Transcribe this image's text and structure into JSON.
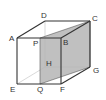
{
  "diagram": {
    "type": "cube-cross-section",
    "vertices": {
      "A": {
        "x": 17,
        "y": 38,
        "lx": 9,
        "ly": 41
      },
      "B": {
        "x": 61,
        "y": 38,
        "lx": 63,
        "ly": 45
      },
      "C": {
        "x": 90,
        "y": 21,
        "lx": 92,
        "ly": 21
      },
      "D": {
        "x": 45,
        "y": 21,
        "lx": 41,
        "ly": 18
      },
      "E": {
        "x": 17,
        "y": 84,
        "lx": 10,
        "ly": 92
      },
      "F": {
        "x": 61,
        "y": 84,
        "lx": 60,
        "ly": 92
      },
      "G": {
        "x": 90,
        "y": 67,
        "lx": 93,
        "ly": 73
      },
      "H": {
        "x": 45,
        "y": 67,
        "lx": 46,
        "ly": 66
      },
      "P": {
        "x": 40,
        "y": 38,
        "lx": 33,
        "ly": 46
      },
      "Q": {
        "x": 40,
        "y": 84,
        "lx": 37,
        "ly": 92
      }
    },
    "labels": {
      "A": "A",
      "B": "B",
      "C": "C",
      "D": "D",
      "E": "E",
      "F": "F",
      "G": "G",
      "H": "H",
      "P": "P",
      "Q": "Q"
    },
    "shaded_plane": [
      "P",
      "C",
      "G",
      "Q"
    ],
    "visible_edges": [
      [
        "A",
        "B"
      ],
      [
        "B",
        "C"
      ],
      [
        "C",
        "D"
      ],
      [
        "D",
        "A"
      ],
      [
        "A",
        "E"
      ],
      [
        "B",
        "F"
      ],
      [
        "C",
        "G"
      ],
      [
        "E",
        "F"
      ],
      [
        "F",
        "G"
      ]
    ],
    "hidden_edges": [
      [
        "D",
        "H"
      ],
      [
        "H",
        "E"
      ],
      [
        "H",
        "G"
      ]
    ],
    "colors": {
      "edge": "#333333",
      "hidden_edge": "#c8c8c8",
      "shade": "#b5b5b5"
    }
  }
}
